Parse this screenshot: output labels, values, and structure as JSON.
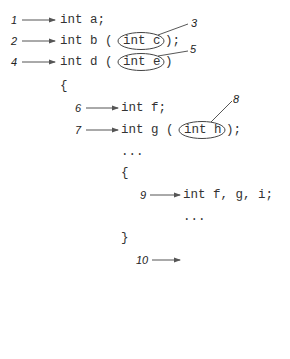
{
  "diagram": {
    "lines": [
      {
        "id": "l1",
        "label": "1",
        "code": "int a;"
      },
      {
        "id": "l2",
        "label": "2",
        "code": "int b (",
        "circled": "int c",
        "after": ");"
      },
      {
        "id": "l4",
        "label": "4",
        "code": "int d (",
        "circled": "int e",
        "after": ")"
      },
      {
        "id": "open1",
        "code": "{"
      },
      {
        "id": "l6",
        "label": "6",
        "code": "int f;"
      },
      {
        "id": "l7",
        "label": "7",
        "code": "int g (",
        "circled": "int h",
        "after": ");"
      },
      {
        "id": "dots1",
        "code": "..."
      },
      {
        "id": "open2",
        "code": "{"
      },
      {
        "id": "l9",
        "label": "9",
        "code": "int f, g, i;"
      },
      {
        "id": "dots2",
        "code": "..."
      },
      {
        "id": "close2",
        "code": "}"
      },
      {
        "id": "open3",
        "code": "{"
      },
      {
        "id": "l10",
        "label": "10",
        "code": "int i;"
      },
      {
        "id": "dots3",
        "code": "..."
      },
      {
        "id": "close3",
        "code": "}"
      },
      {
        "id": "close1",
        "code": "}"
      }
    ],
    "callouts": [
      {
        "label": "3",
        "target": "int c"
      },
      {
        "label": "5",
        "target": "int e"
      },
      {
        "label": "8",
        "target": "int h"
      }
    ],
    "colors": {
      "text": "#333333",
      "arrow": "#555555",
      "background": "#ffffff"
    }
  }
}
